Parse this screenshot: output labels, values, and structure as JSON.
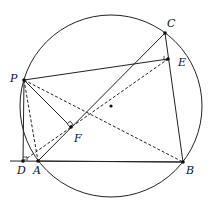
{
  "diagram": {
    "type": "geometry",
    "circle": {
      "cx": 111,
      "cy": 106,
      "r": 91
    },
    "center_dot": {
      "x": 111,
      "y": 106
    },
    "points": [
      {
        "name": "P",
        "x": 24,
        "y": 80,
        "label": "P",
        "lx": 10,
        "ly": 82
      },
      {
        "name": "C",
        "x": 165,
        "y": 33,
        "label": "C",
        "lx": 167,
        "ly": 27
      },
      {
        "name": "E",
        "x": 168,
        "y": 59,
        "label": "E",
        "lx": 178,
        "ly": 66
      },
      {
        "name": "F",
        "x": 71,
        "y": 127,
        "label": "F",
        "lx": 74,
        "ly": 142
      },
      {
        "name": "D",
        "x": 23,
        "y": 161,
        "label": "D",
        "lx": 17,
        "ly": 174
      },
      {
        "name": "A",
        "x": 38,
        "y": 161,
        "label": "A",
        "lx": 33,
        "ly": 174
      },
      {
        "name": "B",
        "x": 183,
        "y": 162,
        "label": "B",
        "lx": 186,
        "ly": 174
      }
    ],
    "solid_segments": [
      [
        "P",
        "E"
      ],
      [
        "P",
        "F"
      ],
      [
        "P",
        "D"
      ],
      [
        "A",
        "C"
      ],
      [
        "C",
        "B"
      ],
      [
        "A",
        "B"
      ]
    ],
    "extended_line": {
      "x1": 10,
      "y1": 161,
      "x2": 183,
      "y2": 162
    },
    "dashed_segments": [
      [
        "P",
        "A"
      ],
      [
        "P",
        "B"
      ],
      [
        "D",
        "E"
      ]
    ],
    "right_angles": [
      "D",
      "F",
      "E"
    ]
  }
}
